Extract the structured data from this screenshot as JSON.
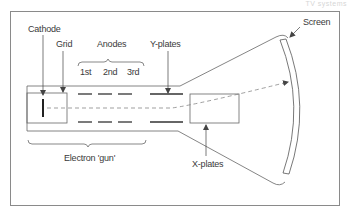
{
  "diagram": {
    "corner_text": "TV systems",
    "labels": {
      "cathode": "Cathode",
      "grid": "Grid",
      "anodes": "Anodes",
      "anode_1": "1st",
      "anode_2": "2nd",
      "anode_3": "3rd",
      "y_plates": "Y-plates",
      "x_plates": "X-plates",
      "screen": "Screen",
      "electron_gun": "Electron 'gun'"
    },
    "colors": {
      "line": "#555555",
      "frame": "#8a8a8a",
      "text": "#3a3a3a"
    }
  }
}
